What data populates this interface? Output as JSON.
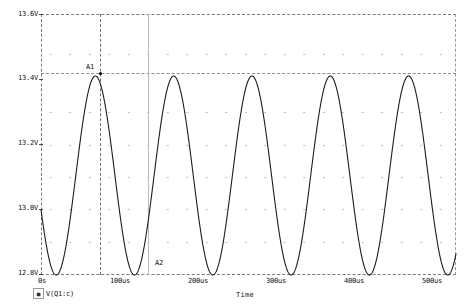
{
  "chart_data": {
    "type": "line",
    "title": "",
    "xlabel": "Time",
    "ylabel": "",
    "xlim": [
      0,
      530
    ],
    "ylim": [
      12.8,
      13.6
    ],
    "x_unit": "us",
    "y_unit": "V",
    "grid": true,
    "legend_position": "bottom-left",
    "x_ticks": [
      "0s",
      "100us",
      "200us",
      "300us",
      "400us",
      "500us"
    ],
    "x_tick_values": [
      0,
      100,
      200,
      300,
      400,
      500
    ],
    "y_ticks": [
      "13.6V",
      "13.4V",
      "13.2V",
      "13.0V",
      "12.8V"
    ],
    "y_tick_values": [
      13.6,
      13.4,
      13.2,
      13.0,
      12.8
    ],
    "series": [
      {
        "name": "V(Q1:c)",
        "color": "#1c1c1c",
        "waveform": "sine",
        "amplitude": 0.305,
        "offset": 13.105,
        "period_us": 100,
        "phase_deg": 200,
        "min": 12.8,
        "max": 13.41,
        "start_value": 13.07
      }
    ],
    "annotations": [
      {
        "label": "A1",
        "x_us": 101,
        "y_v": 13.41,
        "type": "cursor-peak"
      },
      {
        "label": "A2",
        "x_us": 126,
        "y_v": 12.8,
        "type": "cursor-trough"
      }
    ],
    "cursor_lines": {
      "vertical_dashed_x_us": 101,
      "vertical_solid_x_us": 126,
      "horizontal_dashed_y_v": 13.41
    }
  },
  "axes": {
    "y_labels": [
      "13.6V",
      "13.4V",
      "13.2V",
      "13.0V",
      "12.8V"
    ],
    "x_labels": [
      "0s",
      "100us",
      "200us",
      "300us",
      "400us",
      "500us"
    ],
    "x_axis_title": "Time"
  },
  "annotations": {
    "a1": "A1",
    "a2": "A2"
  },
  "legend": {
    "marker_glyph": "■",
    "trace_label": "V(Q1:c)"
  }
}
